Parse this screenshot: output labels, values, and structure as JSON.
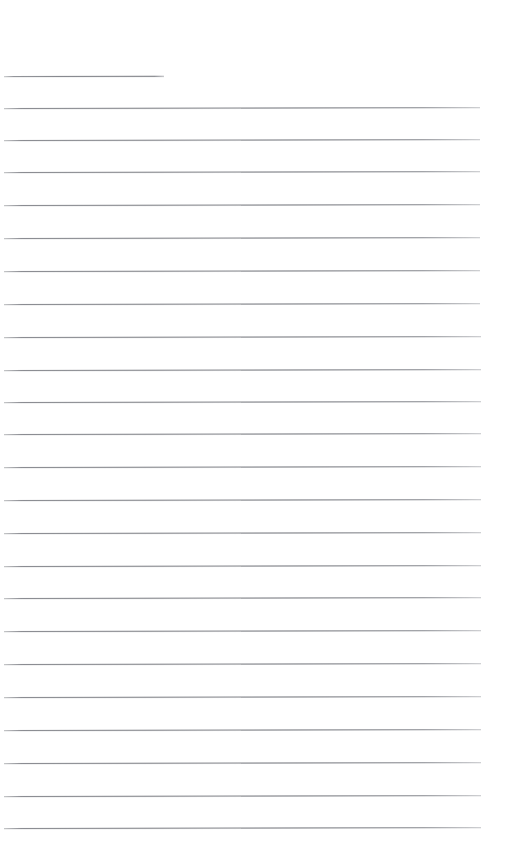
{
  "document": {
    "kind": "scanned-blank-lined-paper",
    "page_width": 509,
    "page_height": 864,
    "background_color": "#ffffff",
    "rule_color": "#7c7e84",
    "rule_thickness_px": 1,
    "visible_text": "",
    "notes": "No text, handwriting, headings, page numbers or markings are present; the page is blank ruled paper."
  },
  "rules": {
    "count": 24,
    "first_line_y": 76,
    "spacing_px": 32.7,
    "left_x": 4,
    "right_x": 480,
    "tilt_deg": -0.12,
    "items": [
      {
        "index": 1,
        "y": 76,
        "left": 4,
        "right": 164,
        "short": true
      },
      {
        "index": 2,
        "y": 108,
        "left": 4,
        "right": 480,
        "short": false
      },
      {
        "index": 3,
        "y": 140,
        "left": 4,
        "right": 480,
        "short": false
      },
      {
        "index": 4,
        "y": 172,
        "left": 4,
        "right": 480,
        "short": false
      },
      {
        "index": 5,
        "y": 205,
        "left": 4,
        "right": 480,
        "short": false
      },
      {
        "index": 6,
        "y": 238,
        "left": 4,
        "right": 480,
        "short": false
      },
      {
        "index": 7,
        "y": 271,
        "left": 4,
        "right": 480,
        "short": false
      },
      {
        "index": 8,
        "y": 304,
        "left": 4,
        "right": 480,
        "short": false
      },
      {
        "index": 9,
        "y": 337,
        "left": 4,
        "right": 481,
        "short": false
      },
      {
        "index": 10,
        "y": 370,
        "left": 4,
        "right": 481,
        "short": false
      },
      {
        "index": 11,
        "y": 402,
        "left": 4,
        "right": 481,
        "short": false
      },
      {
        "index": 12,
        "y": 434,
        "left": 4,
        "right": 481,
        "short": false
      },
      {
        "index": 13,
        "y": 467,
        "left": 4,
        "right": 481,
        "short": false
      },
      {
        "index": 14,
        "y": 500,
        "left": 4,
        "right": 481,
        "short": false
      },
      {
        "index": 15,
        "y": 533,
        "left": 4,
        "right": 481,
        "short": false
      },
      {
        "index": 16,
        "y": 566,
        "left": 4,
        "right": 481,
        "short": false
      },
      {
        "index": 17,
        "y": 598,
        "left": 4,
        "right": 481,
        "short": false
      },
      {
        "index": 18,
        "y": 631,
        "left": 4,
        "right": 481,
        "short": false
      },
      {
        "index": 19,
        "y": 664,
        "left": 4,
        "right": 481,
        "short": false
      },
      {
        "index": 20,
        "y": 697,
        "left": 4,
        "right": 481,
        "short": false
      },
      {
        "index": 21,
        "y": 730,
        "left": 4,
        "right": 481,
        "short": false
      },
      {
        "index": 22,
        "y": 763,
        "left": 4,
        "right": 481,
        "short": false
      },
      {
        "index": 23,
        "y": 796,
        "left": 4,
        "right": 481,
        "short": false
      },
      {
        "index": 24,
        "y": 828,
        "left": 4,
        "right": 481,
        "short": false
      }
    ]
  }
}
